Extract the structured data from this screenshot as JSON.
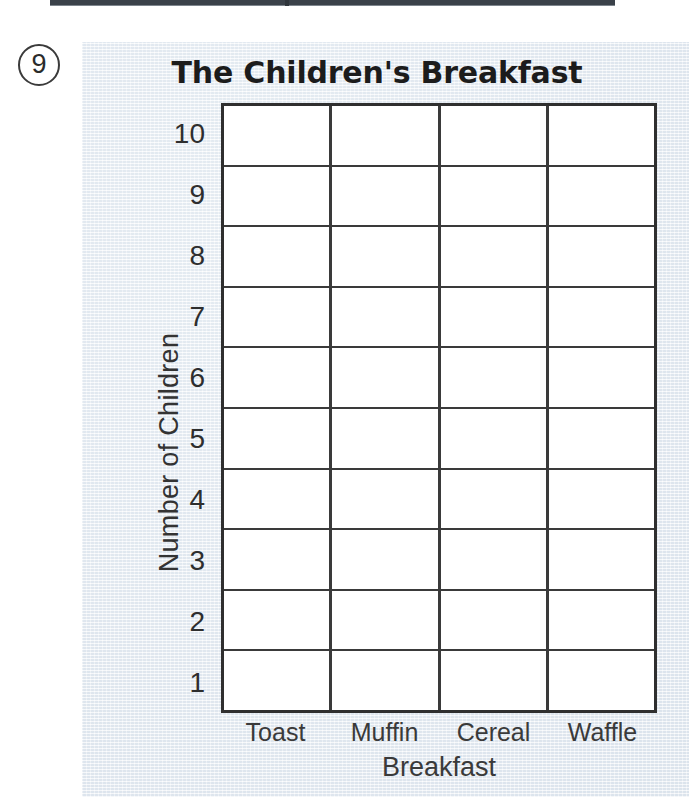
{
  "worksheet": {
    "question_number": "9",
    "top_rule": "cropped-horizontal-rule"
  },
  "chart_data": {
    "type": "bar",
    "title": "The Children's Breakfast",
    "xlabel": "Breakfast",
    "ylabel": "Number of Children",
    "categories": [
      "Toast",
      "Muffin",
      "Cereal",
      "Waffle"
    ],
    "values": [
      0,
      0,
      0,
      0
    ],
    "ytick_labels": [
      "10",
      "9",
      "8",
      "7",
      "6",
      "5",
      "4",
      "3",
      "2",
      "1"
    ],
    "ylim": [
      0,
      10
    ],
    "grid": true,
    "legend": "none",
    "note": "Empty blank bar-graph template: 4 columns x 10 rows, no bars drawn"
  },
  "colors": {
    "panel_background": "#eef2f6",
    "grid_line": "#3a3a3a",
    "grid_border": "#2f2f2f",
    "plot_fill": "#ffffff",
    "text": "#2e2e2e",
    "title_text": "#1c1c1c",
    "rule": "#3a4149"
  }
}
